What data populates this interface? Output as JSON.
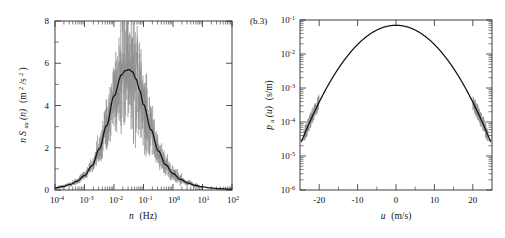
{
  "figure": {
    "background_color": "#ffffff",
    "curve_color": "#111111",
    "noise_color": "#8d8d8d"
  },
  "panels": [
    {
      "id": "panel-a",
      "label": "",
      "chart_ref": 0
    },
    {
      "id": "panel-b",
      "label": "(b.3)",
      "chart_ref": 1
    }
  ],
  "chart_data": [
    {
      "type": "line",
      "title": "",
      "panel_label": "",
      "xlabel_parts": {
        "symbol": "n",
        "units": "(Hz)"
      },
      "ylabel_parts": {
        "prefix": "n",
        "symbol": "S",
        "subscript": "uu",
        "arg": "(n)",
        "units_open": "(m",
        "units_sup": "2",
        "units_rest": "/s",
        "units_sup2": "2",
        "units_close": ")"
      },
      "xscale": "log",
      "yscale": "linear",
      "xlim": [
        0.0001,
        100
      ],
      "ylim": [
        0,
        8
      ],
      "xticks": [
        0.0001,
        0.001,
        0.01,
        0.1,
        1,
        10,
        100
      ],
      "xtick_labels": [
        "10-4",
        "10-3",
        "10-2",
        "10-1",
        "10 0",
        "10 1",
        "10 2"
      ],
      "xtick_mantissa": "10",
      "xtick_exponents": [
        "-4",
        "-3",
        "-2",
        "-1",
        "0",
        "1",
        "2"
      ],
      "yticks": [
        0,
        2,
        4,
        6,
        8
      ],
      "ytick_labels": [
        "0",
        "2",
        "4",
        "6",
        "8"
      ],
      "yticks_minor": [
        1,
        3,
        5,
        7
      ],
      "grid": false,
      "legend": "none",
      "series": [
        {
          "name": "fitted spectrum",
          "style": "solid-black",
          "description": "smooth unimodal log-frequency spectrum peaking near n = 0.03 Hz at nS = 5.7",
          "peak_x": 0.03,
          "peak_y": 5.7,
          "x": [
            0.0001,
            0.00018,
            0.00032,
            0.00056,
            0.001,
            0.0018,
            0.0032,
            0.0056,
            0.01,
            0.018,
            0.024,
            0.032,
            0.042,
            0.056,
            0.075,
            0.1,
            0.18,
            0.32,
            0.56,
            1.0,
            1.8,
            3.2,
            5.6,
            10,
            18,
            32,
            56,
            100
          ],
          "y": [
            0.1,
            0.16,
            0.26,
            0.42,
            0.68,
            1.15,
            1.95,
            3.05,
            4.45,
            5.45,
            5.65,
            5.7,
            5.6,
            5.25,
            4.7,
            4.05,
            2.85,
            1.85,
            1.2,
            0.78,
            0.5,
            0.33,
            0.22,
            0.15,
            0.1,
            0.07,
            0.05,
            0.035
          ]
        },
        {
          "name": "measured spectrum (raw)",
          "style": "noisy-gray",
          "description": "raw scattered spectral estimates about the fit, strongest scatter between 0.003 and 1 Hz, excursions up to about 7.4",
          "noise_x_start": 0.0008,
          "noise_x_end": 8.0,
          "max_excursion_y": 7.4
        }
      ]
    },
    {
      "type": "line",
      "title": "",
      "panel_label": "(b.3)",
      "xlabel_parts": {
        "symbol": "u",
        "units": "(m/s)"
      },
      "ylabel_parts": {
        "symbol": "p",
        "subscript": "u",
        "arg": "(u)",
        "units": "(s/m)"
      },
      "xscale": "linear",
      "yscale": "log",
      "xlim": [
        -25,
        25
      ],
      "ylim": [
        1e-06,
        0.1
      ],
      "xticks": [
        -20,
        -10,
        0,
        10,
        20
      ],
      "xtick_labels": [
        "-20",
        "-10",
        "0",
        "10",
        "20"
      ],
      "yticks": [
        0.1,
        0.01,
        0.001,
        0.0001,
        1e-05,
        1e-06
      ],
      "ytick_mantissa": "10",
      "ytick_exponents": [
        "-1",
        "-2",
        "-3",
        "-4",
        "-5",
        "-6"
      ],
      "grid": false,
      "legend": "none",
      "series": [
        {
          "name": "velocity probability density",
          "style": "solid-black",
          "description": "near-Gaussian probability density of longitudinal wind speed, peak about 7e-2 s/m at u = 0 m/s, falling to 1e-6 near u = plus or minus 24 m/s",
          "peak_x": 0,
          "peak_y": 0.07,
          "sigma": 6.2,
          "x": [
            -24.5,
            -23,
            -21,
            -19,
            -17,
            -15,
            -13,
            -11,
            -9,
            -7,
            -5,
            -3,
            -1,
            0,
            1,
            3,
            5,
            7,
            9,
            11,
            13,
            15,
            17,
            19,
            21,
            23,
            24.5
          ],
          "y": [
            1e-06,
            2.6e-06,
            1e-05,
            3.6e-05,
            0.00012,
            0.00035,
            0.00095,
            0.0024,
            0.0056,
            0.012,
            0.024,
            0.043,
            0.066,
            0.07,
            0.066,
            0.043,
            0.024,
            0.012,
            0.0056,
            0.0024,
            0.00095,
            0.00035,
            0.00012,
            3.6e-05,
            1e-05,
            2.6e-06,
            1e-06
          ]
        },
        {
          "name": "measured density (raw)",
          "style": "noisy-gray",
          "description": "sparse scattered bin estimates visible only in the two distribution tails beyond about plus or minus 20 m/s",
          "tail_left_range": [
            -24,
            -20
          ],
          "tail_right_range": [
            20,
            24
          ]
        }
      ]
    }
  ]
}
